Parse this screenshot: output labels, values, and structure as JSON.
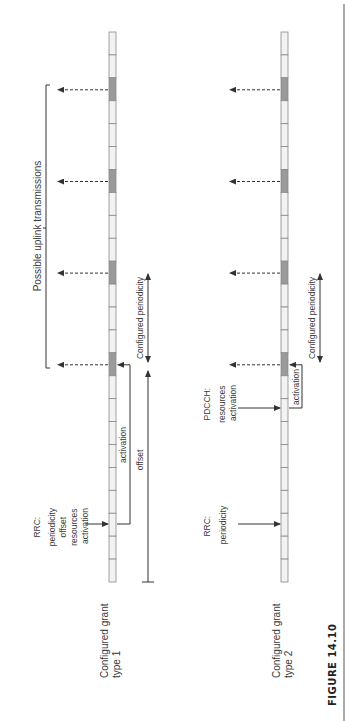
{
  "figure": {
    "caption": "FIGURE 14.10"
  },
  "colors": {
    "slot_fill": "#f2f2f2",
    "slot_stroke": "#8a8a8a",
    "active_slot_fill": "#9a9a9a",
    "line": "#333333"
  },
  "timeline": {
    "slot_count": 24,
    "active_slot_indices": [
      2,
      6,
      10,
      14
    ]
  },
  "type1": {
    "title_line1": "Configured grant",
    "title_line2": "type 1",
    "rrc_label": [
      "RRC:",
      "periodicity",
      "offset",
      "resources",
      "activation"
    ],
    "activation_label": "activation",
    "offset_label": "offset",
    "periodicity_label": "Configured periodicity",
    "uplink_label": "Possible uplink transmissions"
  },
  "type2": {
    "title_line1": "Configured grant",
    "title_line2": "type 2",
    "rrc_label": [
      "RRC:",
      "periodicity"
    ],
    "pdcch_label": [
      "PDCCH:",
      "resources",
      "activation"
    ],
    "activation_label": "activation",
    "periodicity_label": "Configured periodicity"
  }
}
